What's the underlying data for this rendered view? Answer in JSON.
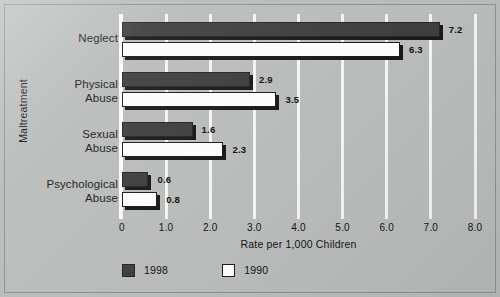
{
  "chart_data": {
    "type": "bar",
    "orientation": "horizontal",
    "title": "",
    "xlabel": "Rate per 1,000 Children",
    "ylabel": "Maltreatment",
    "xlim": [
      0,
      8.0
    ],
    "grid": true,
    "categories": [
      "Neglect",
      "Physical Abuse",
      "Sexual Abuse",
      "Psychological Abuse"
    ],
    "category_lines": [
      [
        "Neglect"
      ],
      [
        "Physical",
        "Abuse"
      ],
      [
        "Sexual",
        "Abuse"
      ],
      [
        "Psychological",
        "Abuse"
      ]
    ],
    "series": [
      {
        "name": "1998",
        "color": "#3f3f41",
        "values": [
          7.2,
          2.9,
          1.6,
          0.6
        ]
      },
      {
        "name": "1990",
        "color": "#fcfcfa",
        "values": [
          6.3,
          3.5,
          2.3,
          0.8
        ]
      }
    ],
    "xticks": [
      0,
      1.0,
      2.0,
      3.0,
      4.0,
      5.0,
      6.0,
      7.0,
      8.0
    ],
    "xtick_labels": [
      "0",
      "1.0",
      "2.0",
      "3.0",
      "4.0",
      "5.0",
      "6.0",
      "7.0",
      "8.0"
    ],
    "data_labels": [
      {
        "category": "Neglect",
        "series": "1998",
        "value": "7.2"
      },
      {
        "category": "Neglect",
        "series": "1990",
        "value": "6.3"
      },
      {
        "category": "Physical Abuse",
        "series": "1998",
        "value": "2.9"
      },
      {
        "category": "Physical Abuse",
        "series": "1990",
        "value": "3.5"
      },
      {
        "category": "Sexual Abuse",
        "series": "1998",
        "value": "1.6"
      },
      {
        "category": "Sexual Abuse",
        "series": "1990",
        "value": "2.3"
      },
      {
        "category": "Psychological Abuse",
        "series": "1998",
        "value": "0.6"
      },
      {
        "category": "Psychological Abuse",
        "series": "1990",
        "value": "0.8"
      }
    ],
    "legend_position": "bottom-left"
  },
  "axes": {
    "x_title": "Rate per 1,000 Children",
    "y_title": "Maltreatment"
  },
  "labels": {
    "cat0_l0": "Neglect",
    "cat1_l0": "Physical",
    "cat1_l1": "Abuse",
    "cat2_l0": "Sexual",
    "cat2_l1": "Abuse",
    "cat3_l0": "Psychological",
    "cat3_l1": "Abuse"
  },
  "ticks": {
    "t0": "0",
    "t1": "1.0",
    "t2": "2.0",
    "t3": "3.0",
    "t4": "4.0",
    "t5": "5.0",
    "t6": "6.0",
    "t7": "7.0",
    "t8": "8.0"
  },
  "values": {
    "neglect_1998": "7.2",
    "neglect_1990": "6.3",
    "physical_1998": "2.9",
    "physical_1990": "3.5",
    "sexual_1998": "1.6",
    "sexual_1990": "2.3",
    "psych_1998": "0.6",
    "psych_1990": "0.8"
  },
  "legend": {
    "series1": "1998",
    "series2": "1990"
  },
  "colors": {
    "background": "#b9bcbb",
    "series_1998": "#3f3f41",
    "series_1990": "#fcfcfa",
    "gridline": "#f2f3f2",
    "text": "#141414"
  }
}
